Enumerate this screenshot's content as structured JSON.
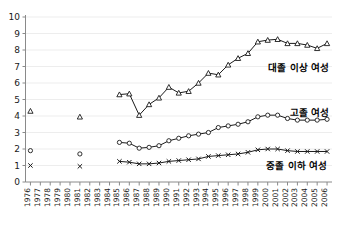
{
  "chart_data": {
    "type": "line",
    "title": "",
    "xlabel": "",
    "ylabel": "",
    "ylim": [
      0,
      10
    ],
    "yticks": [
      0,
      1,
      2,
      3,
      4,
      5,
      6,
      7,
      8,
      9,
      10
    ],
    "grid": true,
    "legend_position": "inline-right",
    "x": [
      1976,
      1977,
      1978,
      1979,
      1980,
      1981,
      1982,
      1983,
      1984,
      1985,
      1986,
      1987,
      1988,
      1989,
      1990,
      1991,
      1992,
      1993,
      1994,
      1995,
      1996,
      1997,
      1998,
      1999,
      2000,
      2001,
      2002,
      2003,
      2004,
      2005,
      2006
    ],
    "categories": [
      "1976",
      "1977",
      "1978",
      "1979",
      "1980",
      "1981",
      "1982",
      "1983",
      "1984",
      "1985",
      "1986",
      "1987",
      "1988",
      "1989",
      "1990",
      "1991",
      "1992",
      "1993",
      "1994",
      "1995",
      "1996",
      "1997",
      "1998",
      "1999",
      "2000",
      "2001",
      "2002",
      "2003",
      "2004",
      "2005",
      "2006"
    ],
    "series": [
      {
        "name": "대졸 이상 여성",
        "marker": "triangle",
        "label_text": "대졸 이상 여성",
        "values": [
          4.3,
          null,
          null,
          null,
          null,
          3.95,
          null,
          null,
          null,
          5.3,
          5.35,
          4.05,
          4.7,
          5.1,
          5.75,
          5.4,
          5.5,
          6.0,
          6.6,
          6.5,
          7.1,
          7.5,
          7.8,
          8.5,
          8.6,
          8.65,
          8.4,
          8.4,
          8.3,
          8.1,
          8.4
        ]
      },
      {
        "name": "고졸 여성",
        "marker": "circle",
        "label_text": "고졸 여성",
        "values": [
          1.9,
          null,
          null,
          null,
          null,
          1.7,
          null,
          null,
          null,
          2.4,
          2.35,
          2.05,
          2.1,
          2.2,
          2.5,
          2.65,
          2.8,
          2.9,
          3.0,
          3.3,
          3.4,
          3.5,
          3.65,
          3.95,
          4.05,
          4.05,
          3.85,
          3.75,
          3.75,
          3.75,
          3.8
        ]
      },
      {
        "name": "중졸 이하 여성",
        "marker": "x",
        "label_text": "중졸 이하 여성",
        "values": [
          1.0,
          null,
          null,
          null,
          null,
          0.95,
          null,
          null,
          null,
          1.25,
          1.2,
          1.1,
          1.1,
          1.15,
          1.25,
          1.3,
          1.35,
          1.4,
          1.55,
          1.6,
          1.65,
          1.7,
          1.8,
          1.95,
          2.0,
          2.0,
          1.9,
          1.85,
          1.85,
          1.85,
          1.85
        ]
      }
    ],
    "colors": {
      "line": "#1a1a1a",
      "grid": "#ededed",
      "axis": "#8a8a8a",
      "background": "#ffffff",
      "text": "#1a1a1a"
    }
  }
}
